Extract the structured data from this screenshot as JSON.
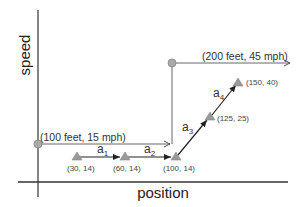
{
  "axes": {
    "y_label": "speed",
    "x_label": "position"
  },
  "thresholds": [
    {
      "label": "(100 feet, 15 mph)"
    },
    {
      "label": "(200 feet, 45 mph)"
    }
  ],
  "points": [
    {
      "label": "(30, 14)"
    },
    {
      "label": "(60, 14)"
    },
    {
      "label": "(100, 14)"
    },
    {
      "label": "(125, 25)"
    },
    {
      "label": "(150, 40)"
    }
  ],
  "segments": [
    {
      "name": "a",
      "sub": "1"
    },
    {
      "name": "a",
      "sub": "2"
    },
    {
      "name": "a",
      "sub": "3"
    },
    {
      "name": "a",
      "sub": "4"
    }
  ],
  "colors": {
    "axis": "#333333",
    "line": "#555555",
    "marker": "#999999"
  }
}
